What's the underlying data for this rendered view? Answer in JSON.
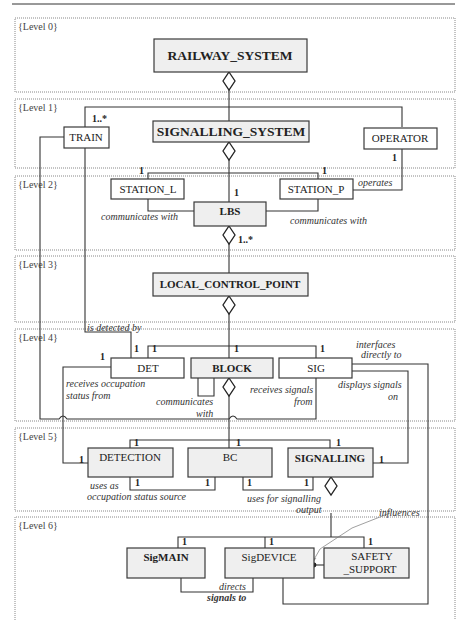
{
  "diagram": {
    "type": "UML class / aggregation hierarchy",
    "levels": [
      {
        "label": "{Level 0}",
        "classes": [
          {
            "name": "RAILWAY_SYSTEM",
            "bold": true
          }
        ]
      },
      {
        "label": "{Level 1}",
        "classes": [
          {
            "name": "TRAIN"
          },
          {
            "name": "SIGNALLING_SYSTEM",
            "bold": true
          },
          {
            "name": "OPERATOR"
          }
        ]
      },
      {
        "label": "{Level 2}",
        "classes": [
          {
            "name": "STATION_L"
          },
          {
            "name": "LBS",
            "bold": true
          },
          {
            "name": "STATION_P"
          }
        ]
      },
      {
        "label": "{Level 3}",
        "classes": [
          {
            "name": "LOCAL_CONTROL_POINT",
            "bold": true
          }
        ]
      },
      {
        "label": "{Level 4}",
        "classes": [
          {
            "name": "DET"
          },
          {
            "name": "BLOCK",
            "bold": true
          },
          {
            "name": "SIG"
          }
        ]
      },
      {
        "label": "{Level 5}",
        "classes": [
          {
            "name": "DETECTION"
          },
          {
            "name": "BC"
          },
          {
            "name": "SIGNALLING",
            "bold": true
          }
        ]
      },
      {
        "label": "{Level 6}",
        "classes": [
          {
            "name": "SigMAIN",
            "bold": true
          },
          {
            "name": "SigDEVICE"
          },
          {
            "name": "SAFETY_SUPPORT",
            "line1": "SAFETY",
            "line2": "_SUPPORT"
          }
        ]
      }
    ],
    "roles": {
      "operates": "operates",
      "communicates_with_l": "communicates with",
      "communicates_with_p": "communicates with",
      "is_detected_by": "is detected by",
      "interfaces_1": "interfaces",
      "interfaces_2": "directly to",
      "receives_occ_1": "receives occupation",
      "receives_occ_2": "status from",
      "communicates_1": "communicates",
      "communicates_2": "with",
      "receives_sig_1": "receives signals",
      "receives_sig_2": "from",
      "displays_1": "displays signals",
      "displays_2": "on",
      "uses_as_1": "uses as",
      "uses_as_2": "occupation status source",
      "uses_for_1": "uses for signalling",
      "uses_for_2": "output",
      "influences": "influences",
      "directs_1": "directs",
      "directs_2": "signals to"
    },
    "multiplicities": {
      "one": "1",
      "one_many": "1..*"
    }
  }
}
